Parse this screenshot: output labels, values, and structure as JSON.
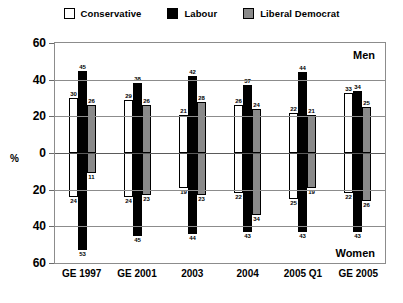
{
  "chart_data": {
    "type": "bar",
    "title": "",
    "xlabel": "",
    "ylabel": "%",
    "ylim": [
      -60,
      60
    ],
    "grid": true,
    "legend_position": "top",
    "categories": [
      "GE 1997",
      "GE 2001",
      "2003",
      "2004",
      "2005 Q1",
      "GE 2005"
    ],
    "ytick_labels": [
      "60",
      "40",
      "20",
      "0",
      "20",
      "40",
      "60"
    ],
    "panel_labels": {
      "top": "Men",
      "bottom": "Women"
    },
    "series": [
      {
        "name": "Conservative",
        "color": "#ffffff",
        "men": [
          30,
          29,
          21,
          26,
          22,
          33
        ],
        "women": [
          24,
          24,
          19,
          22,
          25,
          22
        ]
      },
      {
        "name": "Labour",
        "color": "#000000",
        "men": [
          45,
          38,
          42,
          37,
          44,
          34
        ],
        "women": [
          53,
          45,
          44,
          43,
          43,
          43
        ]
      },
      {
        "name": "Liberal Democrat",
        "color": "#8a8a8a",
        "men": [
          26,
          26,
          28,
          24,
          21,
          25
        ],
        "women": [
          11,
          23,
          23,
          34,
          19,
          26
        ]
      }
    ]
  },
  "legend": {
    "items": [
      {
        "label": "Conservative",
        "swatch": "legend-swatch-conservative"
      },
      {
        "label": "Labour",
        "swatch": "legend-swatch-labour"
      },
      {
        "label": "Liberal Democrat",
        "swatch": "legend-swatch-libdem"
      }
    ]
  },
  "axis": {
    "y_unit": "%",
    "y_labels": [
      "60",
      "40",
      "20",
      "0",
      "20",
      "40",
      "60"
    ],
    "x_labels": [
      "GE 1997",
      "GE 2001",
      "2003",
      "2004",
      "2005 Q1",
      "GE 2005"
    ]
  },
  "captions": {
    "men": "Men",
    "women": "Women"
  }
}
